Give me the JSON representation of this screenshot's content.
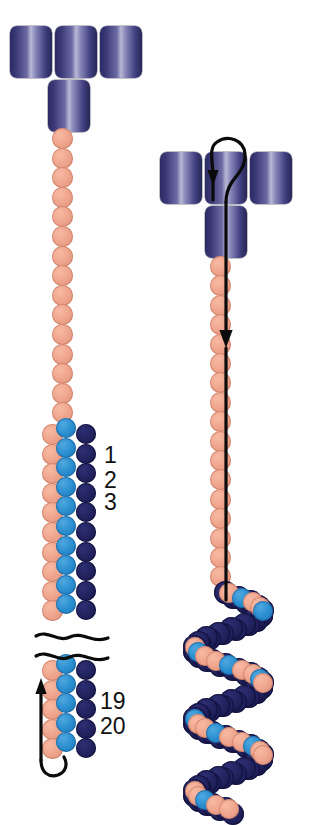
{
  "figure": {
    "colors": {
      "domain_cylinder_dark": "#2b2a63",
      "domain_cylinder_light": "#b9b8d6",
      "bead_salmon": "#f0a78f",
      "bead_light_blue": "#2b8fd0",
      "bead_navy": "#22235f",
      "ink": "#0b0b0b",
      "background": "#ffffff"
    },
    "panels": [
      {
        "id": "left",
        "name": "extended-conformation",
        "head_cylinders": 4,
        "repeat_labels": [
          "1",
          "2",
          "3"
        ],
        "tail_labels": [
          "19",
          "20"
        ],
        "break_marks": 2,
        "bead_columns": [
          "salmon",
          "light-blue",
          "navy"
        ]
      },
      {
        "id": "right",
        "name": "folded-conformation",
        "head_cylinders": 4,
        "repeat_labels": [],
        "tail_labels": [],
        "break_marks": 0,
        "bead_columns": [
          "salmon",
          "light-blue",
          "navy"
        ]
      }
    ],
    "annotations": {
      "left_tail_arrow": "upward-hook-arrow",
      "right_head_loop": "loop-arrow-up",
      "right_axis_arrow": "downward-arrow"
    }
  },
  "left_panel": {
    "cylinders": [
      {
        "x": 10,
        "y": 26,
        "w": 42,
        "h": 52
      },
      {
        "x": 55,
        "y": 26,
        "w": 42,
        "h": 52
      },
      {
        "x": 100,
        "y": 26,
        "w": 42,
        "h": 52
      },
      {
        "x": 48,
        "y": 80,
        "w": 42,
        "h": 52
      }
    ],
    "stem_beads": {
      "x": 52,
      "y_start": 128,
      "count": 15,
      "step": 19.6,
      "size": 21,
      "color": "salmon"
    },
    "triplet_rows": {
      "y_start": 424,
      "count": 10,
      "step": 19.6,
      "salmon": {
        "x": 42,
        "size": 21
      },
      "lblue": {
        "x": 56,
        "size": 20,
        "dy": -6
      },
      "navy": {
        "x": 76,
        "size": 20,
        "dy": 0
      }
    },
    "tail_rows": {
      "y_start": 660,
      "count": 5,
      "step": 19.6,
      "salmon": {
        "x": 42,
        "size": 21
      },
      "lblue": {
        "x": 56,
        "size": 20,
        "dy": -6
      },
      "navy": {
        "x": 76,
        "size": 20,
        "dy": 0
      }
    },
    "labels": [
      {
        "text": "1",
        "x": 104,
        "y": 444
      },
      {
        "text": "2",
        "x": 104,
        "y": 469
      },
      {
        "text": "3",
        "x": 104,
        "y": 491
      },
      {
        "text": "19",
        "x": 100,
        "y": 690
      },
      {
        "text": "20",
        "x": 100,
        "y": 715
      }
    ]
  },
  "right_panel": {
    "cylinders": [
      {
        "x": 160,
        "y": 152,
        "w": 42,
        "h": 52
      },
      {
        "x": 205,
        "y": 152,
        "w": 42,
        "h": 52
      },
      {
        "x": 250,
        "y": 152,
        "w": 42,
        "h": 52
      },
      {
        "x": 205,
        "y": 206,
        "w": 42,
        "h": 52
      }
    ],
    "stem_beads": {
      "x": 210,
      "y_start": 256,
      "count": 17,
      "step": 19.4,
      "size": 21,
      "color": "salmon"
    },
    "cluster": {
      "description": "supercoiled bead cluster",
      "turns": 3,
      "cx": 228,
      "y_start": 592,
      "turn_height": 72
    }
  }
}
